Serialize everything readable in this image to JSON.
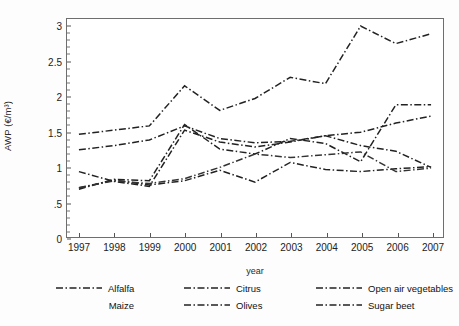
{
  "axes": {
    "ylabel": "AWP (€/m³)",
    "xlabel": "year",
    "yticks": [
      "0",
      ".5",
      "1",
      "1.5",
      "2",
      "2.5",
      "3"
    ],
    "xticks": [
      "1997",
      "1998",
      "1999",
      "2000",
      "2001",
      "2002",
      "2003",
      "2004",
      "2005",
      "2006",
      "2007"
    ]
  },
  "legend": {
    "items": [
      {
        "label": "Alfalfa",
        "swatch": "dashdot-line",
        "visible_swatch": true
      },
      {
        "label": "Maize",
        "swatch": "dashdot-line",
        "visible_swatch": false
      },
      {
        "label": "Citrus",
        "swatch": "dashdot-line",
        "visible_swatch": true
      },
      {
        "label": "Olives",
        "swatch": "dashdot-line",
        "visible_swatch": true
      },
      {
        "label": "Open air vegetables",
        "swatch": "dashdot-line",
        "visible_swatch": true
      },
      {
        "label": "Sugar beet",
        "swatch": "dashdot-line",
        "visible_swatch": true
      }
    ]
  },
  "chart_data": {
    "type": "line",
    "title": "",
    "xlabel": "year",
    "ylabel": "AWP (€/m³)",
    "x": [
      1997,
      1998,
      1999,
      2000,
      2001,
      2002,
      2003,
      2004,
      2005,
      2006,
      2007
    ],
    "xlim": [
      1997,
      2007
    ],
    "ylim": [
      0,
      3.1
    ],
    "grid": false,
    "legend_position": "below",
    "series": [
      {
        "name": "Open air vegetables",
        "color": "#222222",
        "linestyle": "dashdot",
        "values": [
          1.46,
          1.52,
          1.58,
          2.15,
          1.8,
          1.97,
          2.27,
          2.18,
          3.0,
          2.75,
          2.89
        ]
      },
      {
        "name": "Citrus",
        "color": "#222222",
        "linestyle": "dashdot",
        "values": [
          1.24,
          1.3,
          1.38,
          1.58,
          1.4,
          1.34,
          1.36,
          1.44,
          1.49,
          1.62,
          1.72
        ]
      },
      {
        "name": "Alfalfa",
        "color": "#222222",
        "linestyle": "dashdot",
        "values": [
          0.93,
          0.79,
          0.72,
          1.52,
          1.35,
          1.28,
          1.35,
          1.44,
          1.3,
          1.22,
          0.99
        ]
      },
      {
        "name": "Sugar beet",
        "color": "#222222",
        "linestyle": "dashdot",
        "values": [
          0.68,
          0.82,
          0.8,
          1.6,
          1.25,
          1.18,
          1.4,
          1.33,
          1.07,
          1.88,
          1.88
        ]
      },
      {
        "name": "Olives",
        "color": "#222222",
        "linestyle": "dashdot",
        "values": [
          0.7,
          0.81,
          0.74,
          0.8,
          0.95,
          0.78,
          1.06,
          0.96,
          0.93,
          0.97,
          1.0
        ]
      },
      {
        "name": "Maize",
        "color": "#333333",
        "linestyle": "dashdot",
        "values": [
          0.7,
          0.8,
          0.76,
          0.83,
          0.99,
          1.18,
          1.13,
          1.17,
          1.21,
          0.93,
          0.98
        ]
      }
    ]
  },
  "caption": {
    "fragment": ""
  }
}
